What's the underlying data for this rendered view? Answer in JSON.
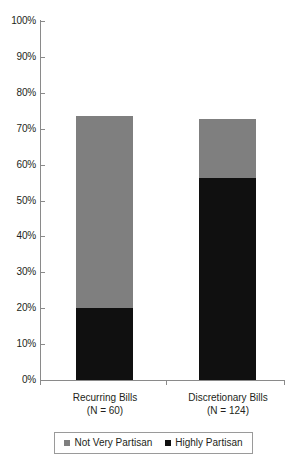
{
  "chart_data": {
    "type": "bar",
    "title": "",
    "xlabel": "",
    "ylabel": "",
    "stacked": true,
    "grid": false,
    "legend_position": "bottom",
    "categories": [
      "Recurring Bills",
      "Discretionary Bills"
    ],
    "category_sublabels": [
      "(N = 60)",
      "(N = 124)"
    ],
    "ylim": [
      0,
      100
    ],
    "ytick_labels": [
      "0%",
      "10%",
      "20%",
      "30%",
      "40%",
      "50%",
      "60%",
      "70%",
      "80%",
      "90%",
      "100%"
    ],
    "ytick_values": [
      0,
      10,
      20,
      30,
      40,
      50,
      60,
      70,
      80,
      90,
      100
    ],
    "series": [
      {
        "name": "Highly Partisan",
        "color": "#101010",
        "values": [
          20.0,
          56.3
        ]
      },
      {
        "name": "Not Very Partisan",
        "color": "#7f7f7f",
        "values": [
          53.5,
          16.4
        ]
      }
    ],
    "totals": [
      73.5,
      72.7
    ]
  },
  "legend": {
    "items": [
      {
        "label": "Not Very Partisan",
        "color": "#7f7f7f"
      },
      {
        "label": "Highly Partisan",
        "color": "#101010"
      }
    ]
  }
}
